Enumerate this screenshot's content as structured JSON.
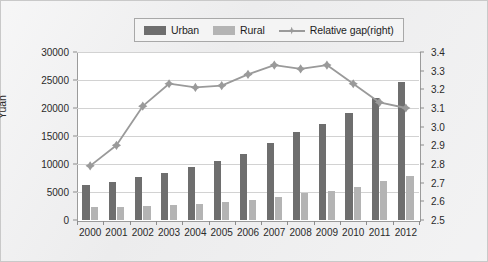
{
  "legend": {
    "position": "top-center",
    "items": [
      {
        "label": "Urban",
        "type": "bar",
        "color": "#6e6e6e",
        "name": "urban"
      },
      {
        "label": "Rural",
        "type": "bar",
        "color": "#b4b4b4",
        "name": "rural"
      },
      {
        "label": "Relative gap(right)",
        "type": "line",
        "color": "#9a9a9a",
        "name": "relative-gap"
      }
    ]
  },
  "chart_data": {
    "type": "bar",
    "title": "",
    "subtitle": "",
    "xlabel": "",
    "ylabel": "Yuan",
    "y2label": "",
    "categories": [
      "2000",
      "2001",
      "2002",
      "2003",
      "2004",
      "2005",
      "2006",
      "2007",
      "2008",
      "2009",
      "2010",
      "2011",
      "2012"
    ],
    "ylim": [
      0,
      30000
    ],
    "yticks": [
      0,
      5000,
      10000,
      15000,
      20000,
      25000,
      30000
    ],
    "ytick_labels": [
      "0",
      "5000",
      "10000",
      "15000",
      "20000",
      "25000",
      "30000"
    ],
    "y2lim": [
      2.5,
      3.4
    ],
    "y2ticks": [
      2.5,
      2.6,
      2.7,
      2.8,
      2.9,
      3.0,
      3.1,
      3.2,
      3.3,
      3.4
    ],
    "y2tick_labels": [
      "2.5",
      "2.6",
      "2.7",
      "2.8",
      "2.9",
      "3.0",
      "3.1",
      "3.2",
      "3.3",
      "3.4"
    ],
    "grid": true,
    "legend_position": "top-center",
    "series": [
      {
        "name": "Urban",
        "type": "bar",
        "axis": "left",
        "color": "#6e6e6e",
        "values": [
          6280,
          6860,
          7703,
          8472,
          9422,
          10493,
          11760,
          13786,
          15781,
          17175,
          19109,
          21810,
          24565
        ]
      },
      {
        "name": "Rural",
        "type": "bar",
        "axis": "left",
        "color": "#b4b4b4",
        "values": [
          2253,
          2366,
          2476,
          2622,
          2936,
          3255,
          3587,
          4140,
          4761,
          5153,
          5919,
          6977,
          7917
        ]
      },
      {
        "name": "Relative gap(right)",
        "type": "line",
        "axis": "right",
        "color": "#9a9a9a",
        "marker": "diamond",
        "values": [
          2.79,
          2.9,
          3.11,
          3.23,
          3.21,
          3.22,
          3.28,
          3.33,
          3.31,
          3.33,
          3.23,
          3.13,
          3.1
        ]
      }
    ]
  }
}
